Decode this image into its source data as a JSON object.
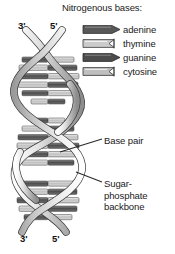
{
  "diagram": {
    "background_color": "#ffffff"
  },
  "legend": {
    "title": "Nitrogenous bases:",
    "items": [
      {
        "label": "adenine",
        "shape": "arrow-right",
        "fill": "#555555",
        "icon": "adenine-swatch"
      },
      {
        "label": "thymine",
        "shape": "notched-right",
        "fill": "#c9c9c9",
        "icon": "thymine-swatch"
      },
      {
        "label": "guanine",
        "shape": "arrow-right",
        "fill": "#4a4a4a",
        "icon": "guanine-swatch"
      },
      {
        "label": "cytosine",
        "shape": "notched-right",
        "fill": "#bdbdbd",
        "icon": "cytosine-swatch"
      }
    ]
  },
  "strand_labels": {
    "top_left": "3'",
    "top_right": "5'",
    "bottom_left": "3'",
    "bottom_right": "5'"
  },
  "callouts": {
    "base_pair": "Base pair",
    "backbone_line1": "Sugar-",
    "backbone_line2": "phosphate",
    "backbone_line3": "backbone"
  },
  "colors": {
    "ribbon_light": "#e8e8e8",
    "ribbon_mid": "#bfbfbf",
    "ribbon_dark": "#8f8f8f",
    "rung_dark": "#5a5a5a",
    "rung_light": "#cccccc",
    "outline": "#3a3a3a",
    "text": "#1a1a1a"
  }
}
